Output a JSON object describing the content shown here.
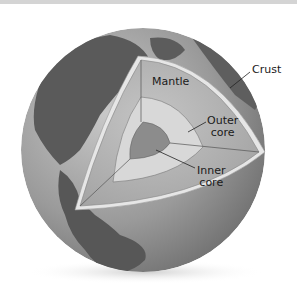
{
  "labels": {
    "crust": "Crust",
    "mantle": "Mantle",
    "outer_core_1": "Outer",
    "outer_core_2": "core",
    "inner_core_1": "Inner",
    "inner_core_2": "core"
  },
  "colors": {
    "ocean": "#9a9a9a",
    "land": "#555555",
    "mantle": "#b5b5b5",
    "outer_core": "#d6d6d6",
    "inner_core": "#8a8a8a",
    "crust": "#e8e8e8"
  }
}
